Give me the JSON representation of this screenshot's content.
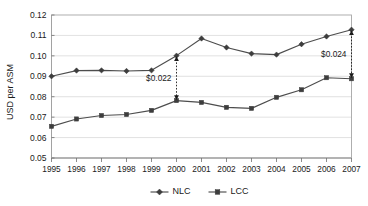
{
  "chart_data": {
    "type": "line",
    "title": "",
    "xlabel": "",
    "ylabel": "USD per ASM",
    "categories": [
      "1995",
      "1996",
      "1997",
      "1998",
      "1999",
      "2000",
      "2001",
      "2002",
      "2003",
      "2004",
      "2005",
      "2006",
      "2007"
    ],
    "ylim": [
      0.05,
      0.12
    ],
    "ytick_step": 0.01,
    "ytick_labels": [
      "0.12",
      "0.11",
      "0.10",
      "0.09",
      "0.08",
      "0.07",
      "0.06",
      "0.05"
    ],
    "ytick_values": [
      0.12,
      0.11,
      0.1,
      0.09,
      0.08,
      0.07,
      0.06,
      0.05
    ],
    "grid": true,
    "legend_position": "bottom",
    "series": [
      {
        "name": "NLC",
        "marker": "diamond",
        "color": "#4d4d4d",
        "values": [
          0.09,
          0.0928,
          0.0929,
          0.0926,
          0.0929,
          0.1001,
          0.1085,
          0.1041,
          0.1011,
          0.1006,
          0.1057,
          0.1095,
          0.1128
        ]
      },
      {
        "name": "LCC",
        "marker": "square",
        "color": "#4d4d4d",
        "values": [
          0.0655,
          0.0691,
          0.0708,
          0.0713,
          0.0733,
          0.0781,
          0.0772,
          0.0748,
          0.0743,
          0.0797,
          0.0834,
          0.0893,
          0.0888
        ]
      }
    ],
    "annotations": [
      {
        "label": "$0.022",
        "at_category": "2000",
        "from_series": "NLC",
        "to_series": "LCC",
        "value_gap": 0.022
      },
      {
        "label": "$0.024",
        "at_category": "2007",
        "from_series": "NLC",
        "to_series": "LCC",
        "value_gap": 0.024
      }
    ]
  },
  "legend": {
    "items": [
      {
        "label": "NLC"
      },
      {
        "label": "LCC"
      }
    ]
  },
  "colors": {
    "line": "#4d4d4d",
    "grid": "#d9d9d9",
    "text": "#1a1a1a",
    "background": "#ffffff"
  }
}
